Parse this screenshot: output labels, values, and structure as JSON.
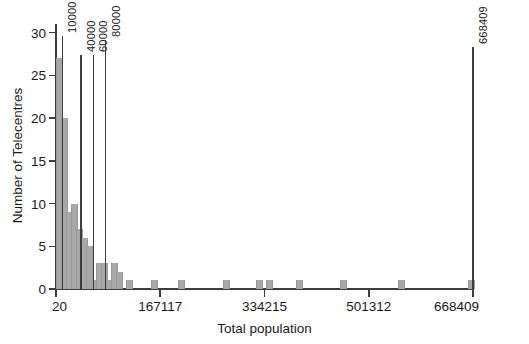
{
  "top_clipped_text": "",
  "chart_data": {
    "type": "bar",
    "title": "",
    "subtitle": "",
    "xlabel": "Total population",
    "ylabel": "Number of Telecentres",
    "xlim": [
      20,
      668409
    ],
    "ylim": [
      0,
      31
    ],
    "grid": false,
    "legend": null,
    "bar_color": "#a8a8a8",
    "axis_color": "#3d3d3d",
    "xticks": [
      20,
      167117,
      334215,
      501312,
      668409
    ],
    "xtick_labels": [
      "20",
      "167117",
      "334215",
      "501312",
      "668409"
    ],
    "yticks": [
      0,
      5,
      10,
      15,
      20,
      25,
      30
    ],
    "ytick_labels": [
      "0",
      "5",
      "10",
      "15",
      "20",
      "25",
      "30"
    ],
    "annotation_lines": [
      {
        "label": "10000",
        "value": 10000
      },
      {
        "label": "40000",
        "value": 40000
      },
      {
        "label": "60000",
        "value": 60000
      },
      {
        "label": "80000",
        "value": 80000
      },
      {
        "label": "668409",
        "value": 668409
      }
    ],
    "bins": [
      {
        "x": 20,
        "width": 8000,
        "count": 27
      },
      {
        "x": 8020,
        "width": 8000,
        "count": 20
      },
      {
        "x": 16020,
        "width": 8000,
        "count": 9
      },
      {
        "x": 24020,
        "width": 8000,
        "count": 10
      },
      {
        "x": 32020,
        "width": 8000,
        "count": 7
      },
      {
        "x": 40020,
        "width": 8000,
        "count": 6
      },
      {
        "x": 48020,
        "width": 8000,
        "count": 5
      },
      {
        "x": 56020,
        "width": 8000,
        "count": 1
      },
      {
        "x": 64020,
        "width": 8000,
        "count": 3
      },
      {
        "x": 72020,
        "width": 8000,
        "count": 3
      },
      {
        "x": 80020,
        "width": 8000,
        "count": 1
      },
      {
        "x": 88020,
        "width": 8000,
        "count": 3
      },
      {
        "x": 96020,
        "width": 8000,
        "count": 2
      },
      {
        "x": 112020,
        "width": 8000,
        "count": 1
      },
      {
        "x": 152020,
        "width": 8000,
        "count": 1
      },
      {
        "x": 196020,
        "width": 8000,
        "count": 1
      },
      {
        "x": 268020,
        "width": 8000,
        "count": 1
      },
      {
        "x": 320020,
        "width": 8000,
        "count": 1
      },
      {
        "x": 336020,
        "width": 8000,
        "count": 1
      },
      {
        "x": 384020,
        "width": 8000,
        "count": 1
      },
      {
        "x": 456020,
        "width": 8000,
        "count": 1
      },
      {
        "x": 548020,
        "width": 8000,
        "count": 1
      },
      {
        "x": 660020,
        "width": 8000,
        "count": 1
      }
    ]
  }
}
